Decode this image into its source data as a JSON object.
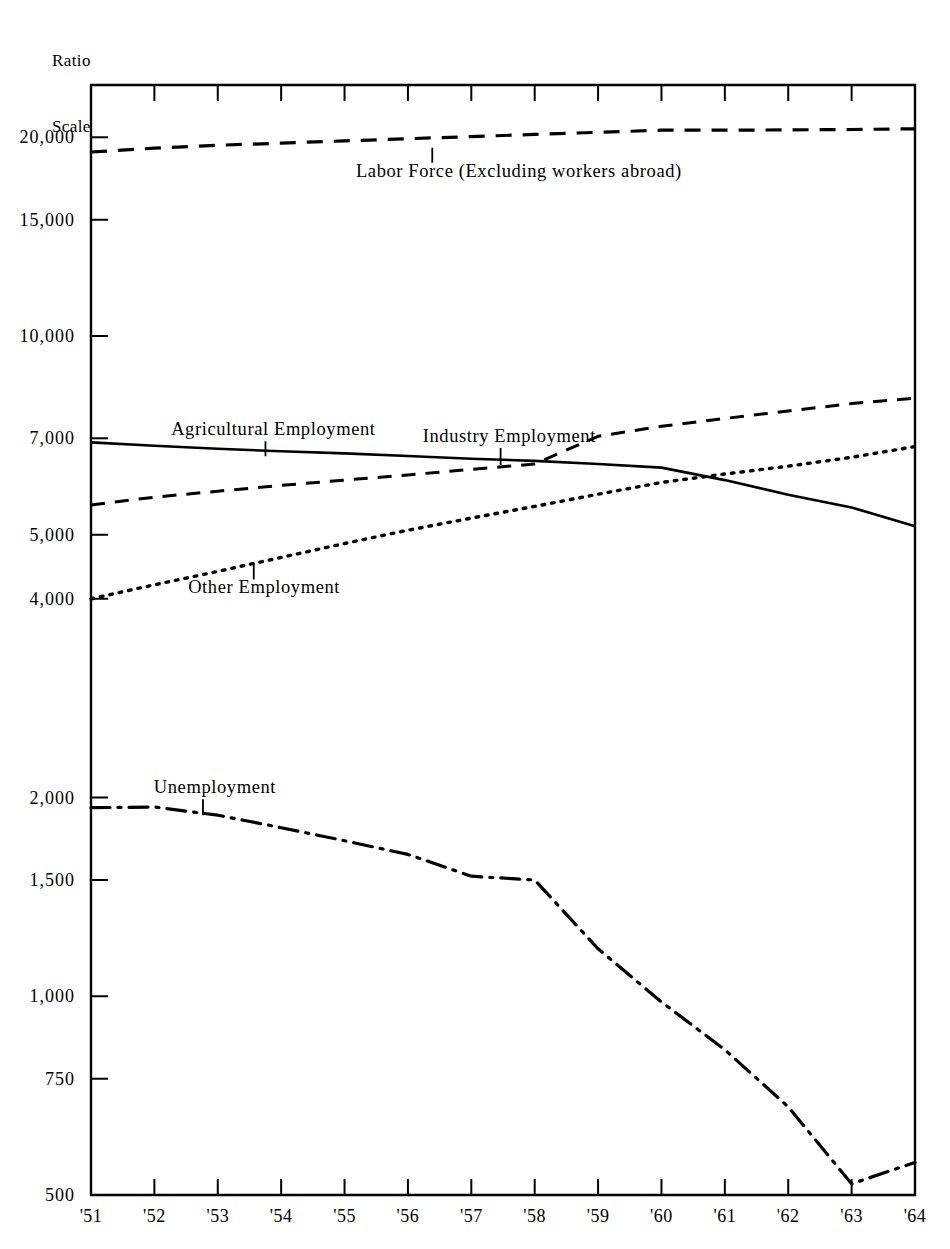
{
  "header": {
    "axis_note_line1": "Ratio",
    "axis_note_line2": "Scale"
  },
  "chart_data": {
    "type": "line",
    "title": "",
    "subtitle": "",
    "xlabel": "",
    "ylabel": "Ratio Scale",
    "scale": "log",
    "grid": false,
    "legend_position": "inline-annotations",
    "x": [
      "'51",
      "'52",
      "'53",
      "'54",
      "'55",
      "'56",
      "'57",
      "'58",
      "'59",
      "'60",
      "'61",
      "'62",
      "'63",
      "'64"
    ],
    "xlim": [
      "'51",
      "'64"
    ],
    "ylim": [
      500,
      24000
    ],
    "ytick_labels": [
      "20,000",
      "15,000",
      "10,000",
      "7,000",
      "5,000",
      "4,000",
      "2,000",
      "1,500",
      "1,000",
      "750",
      "500"
    ],
    "ytick_values": [
      20000,
      15000,
      10000,
      7000,
      5000,
      4000,
      2000,
      1500,
      1000,
      750,
      500
    ],
    "series": [
      {
        "name": "Labor Force (Excluding workers abroad)",
        "style": "dashed",
        "label_x": "'56",
        "values": [
          19000,
          19250,
          19450,
          19600,
          19750,
          19900,
          20050,
          20200,
          20350,
          20500,
          20500,
          20520,
          20550,
          20600
        ]
      },
      {
        "name": "Agricultural Employment",
        "style": "solid",
        "label_x": "'54",
        "values": [
          6900,
          6820,
          6750,
          6690,
          6640,
          6580,
          6520,
          6470,
          6400,
          6320,
          6050,
          5750,
          5500,
          5150
        ]
      },
      {
        "name": "Industry Employment",
        "style": "dashed-short",
        "label_x": "'58",
        "values": [
          5550,
          5700,
          5820,
          5940,
          6050,
          6160,
          6280,
          6400,
          7050,
          7300,
          7500,
          7700,
          7900,
          8050
        ]
      },
      {
        "name": "Other Employment",
        "style": "dotted",
        "label_x": "'54",
        "values": [
          4000,
          4200,
          4400,
          4620,
          4850,
          5080,
          5300,
          5520,
          5760,
          6000,
          6180,
          6350,
          6550,
          6800
        ]
      },
      {
        "name": "Unemployment",
        "style": "dash-dot",
        "label_x": "'53",
        "values": [
          1930,
          1935,
          1880,
          1800,
          1720,
          1640,
          1520,
          1500,
          1180,
          980,
          830,
          680,
          520,
          560
        ]
      }
    ]
  }
}
